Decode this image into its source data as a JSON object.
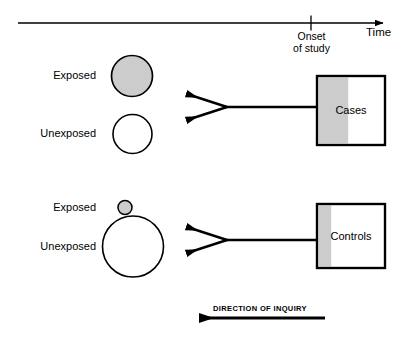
{
  "figure": {
    "type": "case-control-study-schematic",
    "background_color": "#ffffff",
    "line_color": "#000000",
    "fill_gray": "#cccccc"
  },
  "timeline": {
    "axis_label": "Time",
    "onset_line1": "Onset",
    "onset_line2": "of study",
    "tick_present": true,
    "arrow_direction": "right"
  },
  "groups": [
    {
      "id": "cases-group",
      "rows": [
        {
          "label": "Exposed",
          "circle": "large-gray"
        },
        {
          "label": "Unexposed",
          "circle": "medium-white"
        }
      ],
      "box_label": "Cases",
      "box_gray_fraction_percent": 45
    },
    {
      "id": "controls-group",
      "rows": [
        {
          "label": "Exposed",
          "circle": "small-gray"
        },
        {
          "label": "Unexposed",
          "circle": "xlarge-white"
        }
      ],
      "box_label": "Controls",
      "box_gray_fraction_percent": 20
    }
  ],
  "inquiry": {
    "label": "DIRECTION OF INQUIRY",
    "arrow_direction": "left"
  }
}
